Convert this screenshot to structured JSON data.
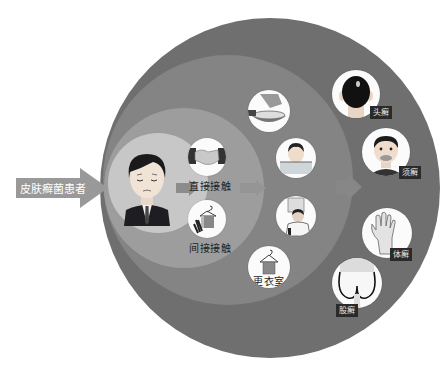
{
  "diagram": {
    "title_arrow": {
      "label": "皮肤癣菌患者",
      "icon": "patient-arrow"
    },
    "colors": {
      "outer_ring": "#6e6e6e",
      "middle_ring": "#838383",
      "inner_ring": "#9c9c9c",
      "core": "#c6c6c6",
      "arrow": "#9a9a9a",
      "tag_bg": "#2a2a2a"
    },
    "source": {
      "name": "patient",
      "icon": "sad-man-in-suit-icon"
    },
    "transmission": [
      {
        "label": "直接接触",
        "icon": "handshake-icon"
      },
      {
        "label": "间接接触",
        "icon": "clothes-hanger-towel-icon"
      }
    ],
    "settings": [
      {
        "label": "",
        "icon": "basin-washing-icon"
      },
      {
        "label": "",
        "icon": "bathing-pool-icon"
      },
      {
        "label": "",
        "icon": "barber-haircut-icon"
      },
      {
        "label": "更衣室",
        "icon": "locker-room-hanger-icon"
      }
    ],
    "diseases": [
      {
        "label": "头癣",
        "icon": "head-back-icon"
      },
      {
        "label": "须癣",
        "icon": "beard-face-icon"
      },
      {
        "label": "体癣",
        "icon": "hand-icon"
      },
      {
        "label": "股癣",
        "icon": "buttocks-icon"
      }
    ]
  }
}
